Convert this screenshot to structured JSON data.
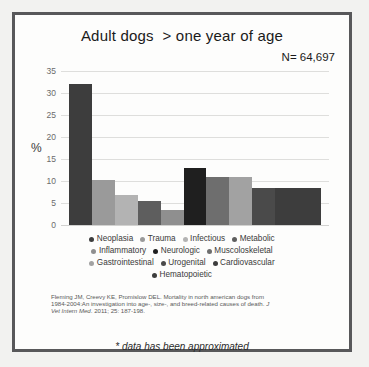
{
  "slide": {
    "title": "Adult dogs  > one year of age",
    "n_label": "N= 64,697",
    "footnote": "* data has been approximated",
    "frame_color": "#58585a",
    "background_color": "#f2f2f0"
  },
  "citation": {
    "line1": "Fleming JM, Creevy KE, Promislow DEL. Mortality in north american dogs from",
    "line2": "1984-2004:An investigation into age-, size-, and breed-related causes of death. ",
    "journal": "J",
    "line3_italic": "Vet Intern Med",
    "line3_rest": ". 2011; 25: 187-198."
  },
  "chart_data": {
    "type": "bar",
    "title": "Adult dogs  > one year of age",
    "xlabel": "",
    "ylabel": "%",
    "ylim": [
      0,
      35
    ],
    "yticks": [
      35,
      30,
      25,
      20,
      15,
      10,
      5,
      0
    ],
    "grid": true,
    "legend_position": "bottom",
    "annotation": "N= 64,697",
    "categories": [
      "Neoplasia",
      "Trauma",
      "Infectious",
      "Metabolic",
      "Inflammatory",
      "Neurologic",
      "Muscoloskeletal",
      "Gastrointestinal",
      "Urogenital",
      "Cardiovascular",
      "Hematopoietic"
    ],
    "values": [
      32,
      10.3,
      6.8,
      5.5,
      3.4,
      13,
      10.8,
      10.8,
      8.4,
      8.4,
      8.4
    ],
    "colors": [
      "#3d3d3d",
      "#9a9a9a",
      "#b3b3b3",
      "#5e5e5e",
      "#8f8f8f",
      "#1f1f1f",
      "#6e6e6e",
      "#a2a2a2",
      "#4a4a4a",
      "#3d3d3d",
      "#3d3d3d"
    ]
  },
  "legend": {
    "rows": [
      [
        {
          "label": "Neoplasia",
          "color": "#3d3d3d"
        },
        {
          "label": "Trauma",
          "color": "#9a9a9a"
        },
        {
          "label": "Infectious",
          "color": "#b3b3b3"
        },
        {
          "label": "Metabolic",
          "color": "#5e5e5e"
        }
      ],
      [
        {
          "label": "Inflammatory",
          "color": "#8f8f8f"
        },
        {
          "label": "Neurologic",
          "color": "#1f1f1f"
        },
        {
          "label": "Muscoloskeletal",
          "color": "#6e6e6e"
        }
      ],
      [
        {
          "label": "Gastrointestinal",
          "color": "#a2a2a2"
        },
        {
          "label": "Urogenital",
          "color": "#4a4a4a"
        },
        {
          "label": "Cardiovascular",
          "color": "#3d3d3d"
        }
      ],
      [
        {
          "label": "Hematopoietic",
          "color": "#3d3d3d"
        }
      ]
    ]
  }
}
